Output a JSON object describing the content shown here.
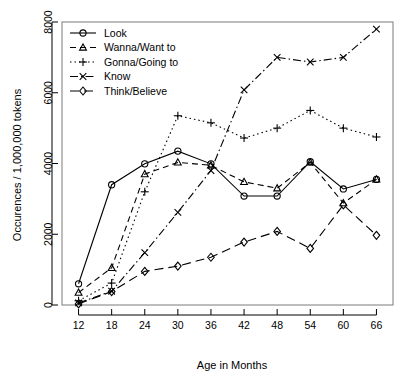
{
  "chart_data": {
    "type": "line",
    "title": "",
    "xlabel": "Age in Months",
    "ylabel": "Occurences / 1,000,000 tokens",
    "x": [
      12,
      18,
      24,
      30,
      36,
      42,
      48,
      54,
      60,
      66
    ],
    "xticklabels": [
      "12",
      "18",
      "24",
      "30",
      "36",
      "42",
      "48",
      "54",
      "60",
      "66"
    ],
    "yticklabels": [
      "0",
      "2000",
      "4000",
      "6000",
      "8000"
    ],
    "yticks": [
      0,
      2000,
      4000,
      6000,
      8000
    ],
    "xlim": [
      9,
      69
    ],
    "ylim": [
      0,
      8000
    ],
    "grid": false,
    "legend_position": "top-left",
    "series": [
      {
        "name": "Look",
        "marker": "circle",
        "dash": "solid",
        "color": "#000000",
        "x": [
          12,
          18,
          24,
          30,
          36,
          42,
          48,
          54,
          60,
          66
        ],
        "values": [
          600,
          3400,
          3990,
          4350,
          3990,
          3080,
          3080,
          4050,
          3280,
          3550
        ]
      },
      {
        "name": "Wanna/Want to",
        "marker": "triangle",
        "dash": "dashed",
        "color": "#000000",
        "x": [
          12,
          18,
          24,
          30,
          36,
          42,
          48,
          54,
          60,
          66
        ],
        "values": [
          350,
          1050,
          3700,
          4030,
          3950,
          3480,
          3300,
          4030,
          2880,
          3550
        ]
      },
      {
        "name": "Gonna/Going to",
        "marker": "plus",
        "dash": "dotted",
        "color": "#000000",
        "x": [
          12,
          18,
          24,
          30,
          36,
          42,
          48,
          54,
          60,
          66
        ],
        "values": [
          120,
          620,
          3200,
          5350,
          5150,
          4720,
          5000,
          5500,
          5000,
          4750
        ]
      },
      {
        "name": "Know",
        "marker": "cross",
        "dash": "dashdot",
        "color": "#000000",
        "x": [
          12,
          18,
          24,
          30,
          36,
          42,
          48,
          54,
          60,
          66
        ],
        "values": [
          60,
          390,
          1480,
          2620,
          3800,
          6080,
          7000,
          6870,
          7000,
          7800
        ]
      },
      {
        "name": "Think/Believe",
        "marker": "diamond",
        "dash": "longdash",
        "color": "#000000",
        "x": [
          12,
          18,
          24,
          30,
          36,
          42,
          48,
          54,
          60,
          66
        ],
        "values": [
          30,
          380,
          950,
          1100,
          1350,
          1780,
          2080,
          1600,
          2830,
          1970
        ]
      }
    ]
  },
  "legend": {
    "items": [
      {
        "label": "Look"
      },
      {
        "label": "Wanna/Want to"
      },
      {
        "label": "Gonna/Going to"
      },
      {
        "label": "Know"
      },
      {
        "label": "Think/Believe"
      }
    ]
  }
}
